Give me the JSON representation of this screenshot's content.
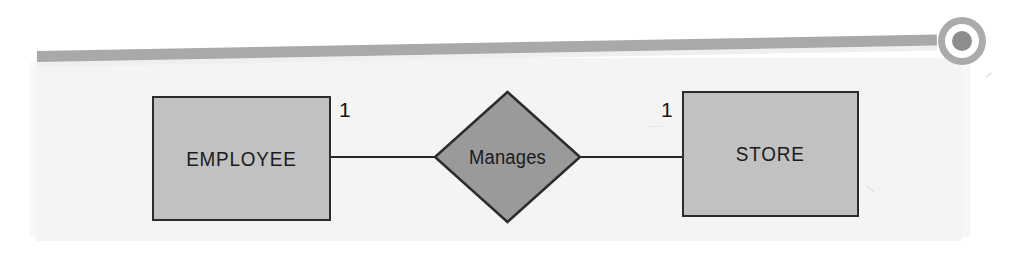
{
  "figure": {
    "type": "er-diagram",
    "notation": "chen",
    "entities": [
      {
        "id": "employee",
        "label": "EMPLOYEE",
        "shape": "rectangle",
        "cardinality": "1"
      },
      {
        "id": "store",
        "label": "STORE",
        "shape": "rectangle",
        "cardinality": "1"
      }
    ],
    "relationship": {
      "id": "manages",
      "label": "Manages",
      "shape": "diamond",
      "from": "EMPLOYEE",
      "to": "STORE",
      "cardinality_from": "1",
      "cardinality_to": "1",
      "cardinality_ratio": "1:1"
    },
    "decoration": {
      "rule_icon": "horizontal-rule",
      "bullet_icon": "target-bullet-icon"
    }
  },
  "colors": {
    "page_background": "#ffffff",
    "panel_background": "#f4f4f4",
    "entity_fill": "#c1c1c1",
    "entity_stroke": "#2c2c2c",
    "relationship_fill": "#9a9a9a",
    "relationship_stroke": "#2c2c2c",
    "connector_stroke": "#262626",
    "decoration_gray": "#a9a9a9",
    "text": "#1b1b1b"
  }
}
